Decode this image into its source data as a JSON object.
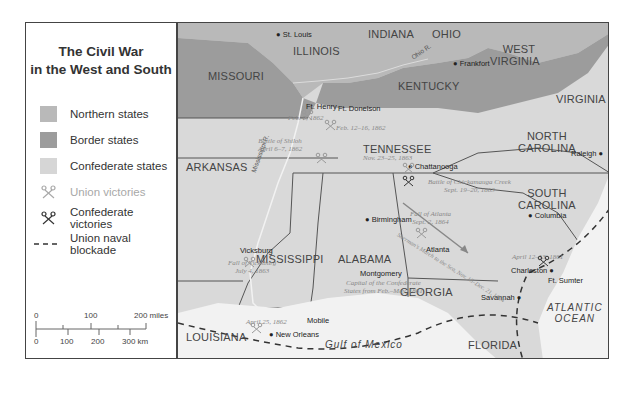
{
  "legend": {
    "title_line1": "The Civil War",
    "title_line2": "in the West and South",
    "items": [
      {
        "label": "Northern states",
        "symbol": "swatch",
        "color": "#b9b9b9"
      },
      {
        "label": "Border states",
        "symbol": "swatch",
        "color": "#9c9c9c"
      },
      {
        "label": "Confederate states",
        "symbol": "swatch",
        "color": "#d6d6d6"
      },
      {
        "label": "Union victories",
        "symbol": "crossed-swords-icon",
        "color": "#a8a8a8"
      },
      {
        "label": "Confederate victories",
        "symbol": "crossed-swords-icon",
        "color": "#333333"
      },
      {
        "label": "Union naval blockade",
        "symbol": "dashed-line",
        "color": "#333333"
      }
    ]
  },
  "scale": {
    "miles_ticks": [
      "0",
      "100",
      "200 miles"
    ],
    "km_ticks": [
      "0",
      "100",
      "200",
      "300 km"
    ]
  },
  "map": {
    "states": {
      "missouri": "MISSOURI",
      "illinois": "ILLINOIS",
      "indiana": "INDIANA",
      "ohio": "OHIO",
      "west_virginia_1": "WEST",
      "west_virginia_2": "VIRGINIA",
      "kentucky": "KENTUCKY",
      "virginia": "VIRGINIA",
      "arkansas": "ARKANSAS",
      "tennessee": "TENNESSEE",
      "north_carolina_1": "NORTH",
      "north_carolina_2": "CAROLINA",
      "south_carolina_1": "SOUTH",
      "south_carolina_2": "CAROLINA",
      "mississippi": "MISSISSIPPI",
      "alabama": "ALABAMA",
      "georgia": "GEORGIA",
      "louisiana": "LOUISIANA",
      "florida": "FLORIDA"
    },
    "rivers": {
      "ohio": "Ohio R.",
      "mississippi": "Mississippi R."
    },
    "cities": {
      "st_louis": "St. Louis",
      "frankfort": "Frankfort",
      "ft_henry": "Ft. Henry",
      "ft_donelson": "Ft. Donelson",
      "chattanooga": "Chattanooga",
      "raleigh": "Raleigh",
      "birmingham": "Birmingham",
      "atlanta": "Atlanta",
      "columbia": "Columbia",
      "vicksburg": "Vicksburg",
      "montgomery": "Montgomery",
      "charleston": "Charleston",
      "ft_sumter": "Ft. Sumter",
      "savannah": "Savannah",
      "mobile": "Mobile",
      "new_orleans": "New Orleans"
    },
    "battles": {
      "ft_henry": "Feb. 6, 1862",
      "ft_donelson": "Feb. 12–16, 1862",
      "shiloh_1": "Battle of Shiloh",
      "shiloh_2": "April 6–7, 1862",
      "chattanooga": "Nov. 23–25, 1863",
      "chickamauga_1": "Battle of Chickamauga Creek",
      "chickamauga_2": "Sept. 19–20, 1863",
      "atlanta_1": "Fall of Atlanta",
      "atlanta_2": "Sept. 2, 1864",
      "vicksburg_1": "Fall of Vicksburg",
      "vicksburg_2": "July 4, 1863",
      "capital_1": "Capital of the Confederate",
      "capital_2": "States from Feb.–May, 1861",
      "sumter": "April 12–13, 1861",
      "new_orleans": "April 25, 1862",
      "sherman": "Sherman's March to the Sea, Nov. 15–Dec. 21, 1864"
    },
    "water": {
      "gulf": "Gulf of Mexico",
      "atlantic_1": "ATLANTIC",
      "atlantic_2": "OCEAN"
    }
  }
}
